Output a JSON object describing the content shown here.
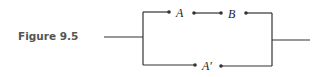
{
  "figure": {
    "caption": "Figure 9.5",
    "switches": {
      "top_left": "A",
      "top_right": "B",
      "bottom": "A′"
    }
  }
}
